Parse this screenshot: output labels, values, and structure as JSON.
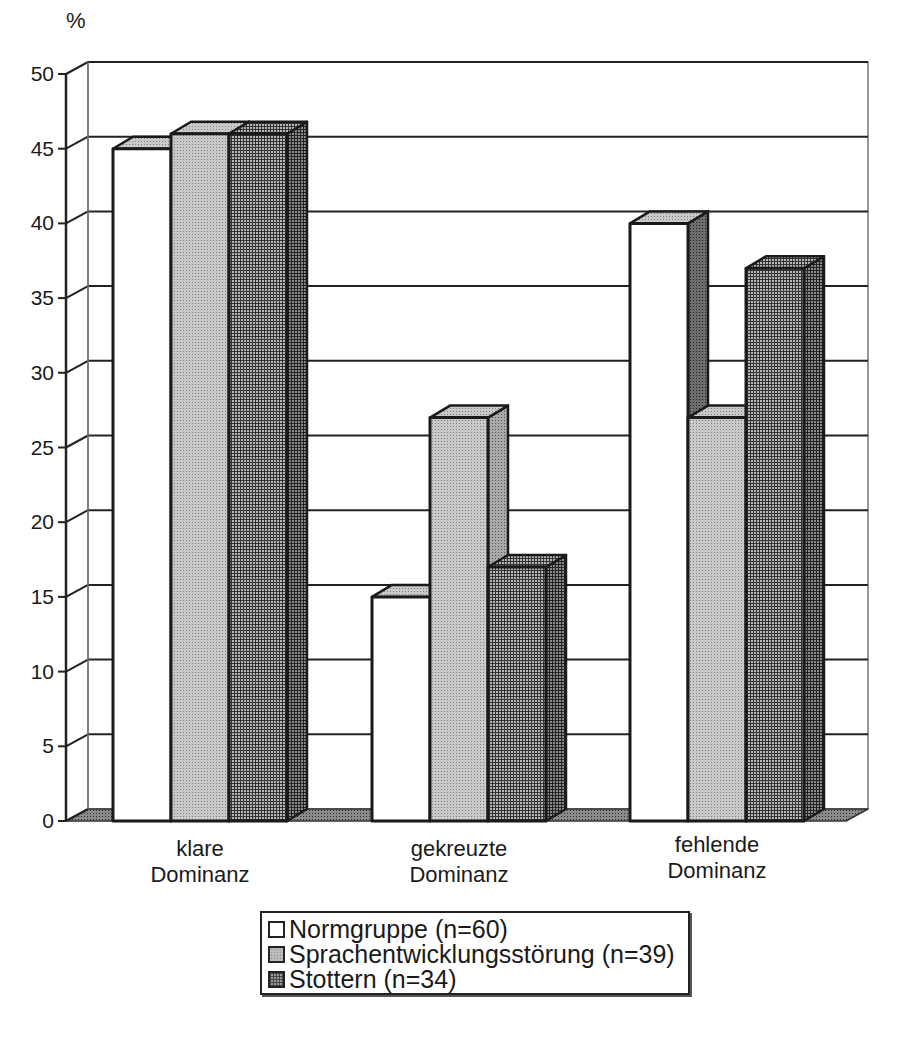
{
  "chart_data": {
    "type": "bar",
    "style": "3d-clustered-column, grayscale patterns",
    "title": "",
    "xlabel": "",
    "ylabel": "%",
    "ylim": [
      0,
      50
    ],
    "yticks": [
      0,
      5,
      10,
      15,
      20,
      25,
      30,
      35,
      40,
      45,
      50
    ],
    "grid": true,
    "legend_position": "bottom",
    "categories": [
      "klare Dominanz",
      "gekreuzte Dominanz",
      "fehlende Dominanz"
    ],
    "category_lines": [
      [
        "klare",
        "Dominanz"
      ],
      [
        "gekreuzte",
        "Dominanz"
      ],
      [
        "fehlende",
        "Dominanz"
      ]
    ],
    "series": [
      {
        "name": "Normgruppe (n=60)",
        "values": [
          45,
          15,
          40
        ],
        "pattern": "white"
      },
      {
        "name": "Sprachentwicklungsstörung (n=39)",
        "values": [
          46,
          27,
          27
        ],
        "pattern": "light-dotted-gray"
      },
      {
        "name": "Stottern (n=34)",
        "values": [
          46,
          17,
          37
        ],
        "pattern": "dark-grid-gray"
      }
    ]
  },
  "axis": {
    "unit_label": "%",
    "ytick_labels": [
      "0",
      "5",
      "10",
      "15",
      "20",
      "25",
      "30",
      "35",
      "40",
      "45",
      "50"
    ]
  },
  "legend": {
    "items": [
      {
        "label": "Normgruppe (n=60)"
      },
      {
        "label": "Sprachentwicklungsstörung (n=39)"
      },
      {
        "label": "Stottern (n=34)"
      }
    ]
  },
  "colors": {
    "outline": "#1a1a1a",
    "normgruppe_fill": "#ffffff",
    "ses_fill": "#bdbdbd",
    "stottern_fill": "#8f8f8f",
    "floor": "#7a7a7a",
    "gridline": "#222222"
  }
}
